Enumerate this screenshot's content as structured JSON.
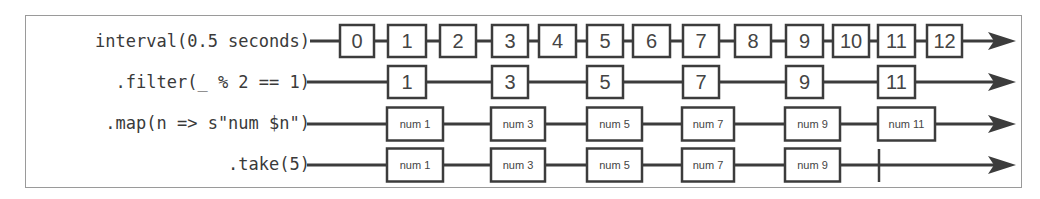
{
  "diagram": {
    "type": "marble-diagram",
    "colors": {
      "line": "#3c3c3c",
      "box_border": "#3c3c3c",
      "box_fill": "#ffffff",
      "text": "#444444",
      "frame": "#9a9a9a"
    },
    "rows": [
      {
        "label": "interval(0.5 seconds)",
        "line_start": 310,
        "values": [
          "0",
          "1",
          "2",
          "3",
          "4",
          "5",
          "6",
          "7",
          "8",
          "9",
          "10",
          "11",
          "12"
        ],
        "terminated": false
      },
      {
        "label": ".filter(_ % 2 == 1)",
        "line_start": 307,
        "values": [
          "1",
          "3",
          "5",
          "7",
          "9",
          "11"
        ],
        "terminated": false
      },
      {
        "label": ".map(n => s\"num $n\")",
        "line_start": 307,
        "values": [
          "num 1",
          "num 3",
          "num 5",
          "num 7",
          "num 9",
          "num 11"
        ],
        "terminated": false
      },
      {
        "label": ".take(5)",
        "line_start": 307,
        "values": [
          "num 1",
          "num 3",
          "num 5",
          "num 7",
          "num 9"
        ],
        "terminated": true,
        "completion_marker_x": 879
      }
    ]
  }
}
